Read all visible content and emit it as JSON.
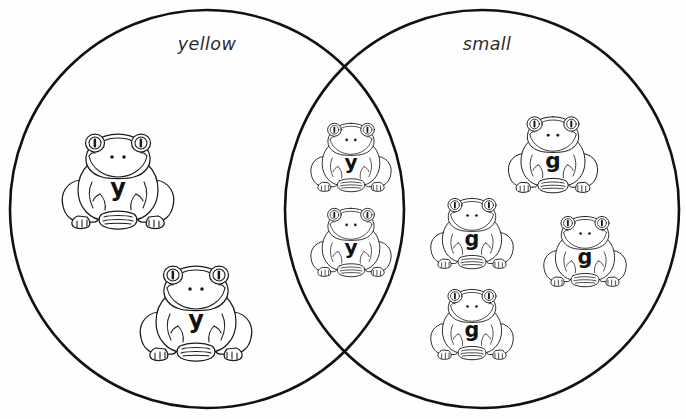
{
  "diagram": {
    "type": "venn-two-set",
    "background_color": "#ffffff",
    "stroke_color": "#111111",
    "title": "",
    "sets": [
      {
        "id": "yellow",
        "label": "yellow",
        "label_x": 207,
        "label_y": 50,
        "cx": 207,
        "cy": 209,
        "rx": 197,
        "ry": 199
      },
      {
        "id": "small",
        "label": "small",
        "label_x": 487,
        "label_y": 50,
        "cx": 482,
        "cy": 209,
        "rx": 197,
        "ry": 199
      }
    ],
    "intersection_points": [
      {
        "x": 347,
        "y": 65
      },
      {
        "x": 348,
        "y": 355
      }
    ],
    "regions": {
      "yellow_only_count": 2,
      "both_count": 2,
      "small_only_count": 4,
      "total_count": 8
    }
  },
  "items": [
    {
      "id": "frog-1",
      "letter": "y",
      "region": "yellow-only",
      "cx": 118,
      "cy": 178,
      "scale": 1.0
    },
    {
      "id": "frog-2",
      "letter": "y",
      "region": "yellow-only",
      "cx": 196,
      "cy": 310,
      "scale": 1.0
    },
    {
      "id": "frog-3",
      "letter": "y",
      "region": "both",
      "cx": 351,
      "cy": 155,
      "scale": 0.72
    },
    {
      "id": "frog-4",
      "letter": "y",
      "region": "both",
      "cx": 351,
      "cy": 240,
      "scale": 0.72
    },
    {
      "id": "frog-5",
      "letter": "g",
      "region": "small-only",
      "cx": 553,
      "cy": 152,
      "scale": 0.8
    },
    {
      "id": "frog-6",
      "letter": "g",
      "region": "small-only",
      "cx": 472,
      "cy": 231,
      "scale": 0.74
    },
    {
      "id": "frog-7",
      "letter": "g",
      "region": "small-only",
      "cx": 585,
      "cy": 249,
      "scale": 0.74
    },
    {
      "id": "frog-8",
      "letter": "g",
      "region": "small-only",
      "cx": 472,
      "cy": 322,
      "scale": 0.74
    }
  ],
  "icons": {
    "frog": "frog-icon",
    "circle_left": "venn-circle-icon",
    "circle_right": "venn-circle-icon"
  }
}
